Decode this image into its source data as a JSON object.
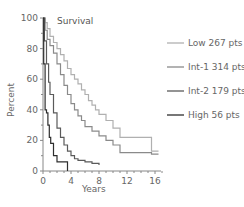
{
  "chart_data": {
    "type": "line",
    "subtype": "kaplan-meier step",
    "title": "Survival",
    "xlabel": "Years",
    "ylabel": "Percent",
    "xlim": [
      0,
      17
    ],
    "ylim": [
      0,
      100
    ],
    "xticks": [
      0,
      4,
      8,
      12,
      16
    ],
    "yticks": [
      0,
      20,
      40,
      60,
      80,
      100
    ],
    "grid": false,
    "legend_position": "right",
    "series": [
      {
        "name": "Low 267 pts",
        "color": "#b0b0b0",
        "x": [
          0,
          0.3,
          0.6,
          1,
          1.5,
          2,
          2.5,
          3,
          3.5,
          4,
          4.5,
          5,
          5.5,
          6,
          6.5,
          7,
          7.5,
          8,
          9,
          10,
          11,
          15.5,
          15.5,
          16.5
        ],
        "y": [
          100,
          97,
          93,
          88,
          84,
          80,
          76,
          72,
          67,
          63,
          60,
          57,
          53,
          50,
          46,
          43,
          40,
          37,
          33,
          28,
          22,
          22,
          13,
          13
        ]
      },
      {
        "name": "Int-1 314 pts",
        "color": "#8a8a8a",
        "x": [
          0,
          0.3,
          0.6,
          1,
          1.5,
          2,
          2.5,
          3,
          3.5,
          4,
          4.5,
          5,
          5.5,
          6,
          7,
          8,
          9,
          10,
          11,
          15.5,
          15.5,
          16.5
        ],
        "y": [
          100,
          92,
          86,
          82,
          77,
          70,
          63,
          56,
          50,
          44,
          40,
          36,
          33,
          29,
          26,
          23,
          20,
          17,
          12,
          12,
          11,
          11
        ]
      },
      {
        "name": "Int-2 179 pts",
        "color": "#5a5a5a",
        "x": [
          0,
          0.2,
          0.5,
          0.8,
          1,
          1.5,
          2,
          2.5,
          3,
          3.5,
          4,
          4.5,
          5,
          6,
          7,
          8
        ],
        "y": [
          100,
          85,
          70,
          58,
          50,
          38,
          28,
          22,
          17,
          13,
          10,
          8,
          7,
          6,
          5,
          4
        ]
      },
      {
        "name": "High 56 pts",
        "color": "#2e2e2e",
        "x": [
          0,
          0.1,
          0.3,
          0.5,
          0.7,
          0.9,
          1.1,
          1.5,
          2,
          3.5,
          3.5
        ],
        "y": [
          100,
          70,
          40,
          38,
          30,
          22,
          18,
          10,
          6,
          6,
          0
        ]
      }
    ]
  },
  "labels": {
    "title": "Survival",
    "xlabel": "Years",
    "ylabel": "Percent",
    "xticks": [
      "0",
      "4",
      "8",
      "12",
      "16"
    ],
    "yticks": [
      "100",
      "80",
      "60",
      "40",
      "20",
      "0"
    ]
  },
  "legend": [
    {
      "label": "Low 267 pts",
      "color": "#b0b0b0"
    },
    {
      "label": "Int-1 314 pts",
      "color": "#8a8a8a"
    },
    {
      "label": "Int-2 179 pts",
      "color": "#5a5a5a"
    },
    {
      "label": "High 56 pts",
      "color": "#2e2e2e"
    }
  ]
}
